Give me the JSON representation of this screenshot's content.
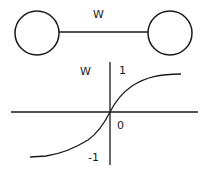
{
  "network": {
    "weight_label": "W",
    "nodes": [
      {
        "name": "input-neuron",
        "cx": 37,
        "cy": 33,
        "r": 22
      },
      {
        "name": "output-neuron",
        "cx": 170,
        "cy": 33,
        "r": 22
      }
    ],
    "connection": {
      "x1": 59,
      "y1": 32,
      "x2": 148,
      "y2": 32
    }
  },
  "graph": {
    "y_axis_label": "W",
    "tick_top": "1",
    "tick_origin": "0",
    "tick_bottom": "-1",
    "curve_type": "sigmoid (tanh-like)",
    "y_range": [
      -1,
      1
    ]
  },
  "colors": {
    "stroke": "#1a1a1a",
    "background": "#ffffff"
  }
}
